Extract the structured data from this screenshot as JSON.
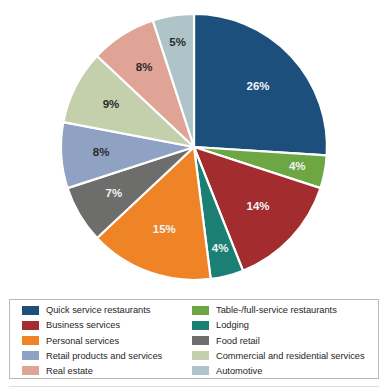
{
  "chart_data": {
    "type": "pie",
    "title": "",
    "subtitle": "",
    "xlabel": "",
    "ylabel": "",
    "grid": false,
    "legend_position": "bottom",
    "units": "percent",
    "total": 100,
    "start_angle_deg": 0,
    "direction": "clockwise",
    "categories": [
      "Quick service restaurants",
      "Table-/full-service restaurants",
      "Business services",
      "Lodging",
      "Personal services",
      "Food retail",
      "Retail products and services",
      "Commercial and residential services",
      "Real estate",
      "Automotive"
    ],
    "values": [
      26,
      4,
      14,
      4,
      15,
      7,
      8,
      9,
      8,
      5
    ],
    "slices": [
      {
        "label": "Quick service restaurants",
        "value": 26,
        "display": "26%",
        "color": "#1c4f7c",
        "label_color": "light"
      },
      {
        "label": "Table-/full-service restaurants",
        "value": 4,
        "display": "4%",
        "color": "#6da743",
        "label_color": "light"
      },
      {
        "label": "Business services",
        "value": 14,
        "display": "14%",
        "color": "#a32c2e",
        "label_color": "light"
      },
      {
        "label": "Lodging",
        "value": 4,
        "display": "4%",
        "color": "#1b7f73",
        "label_color": "light"
      },
      {
        "label": "Personal services",
        "value": 15,
        "display": "15%",
        "color": "#ef8426",
        "label_color": "light"
      },
      {
        "label": "Food retail",
        "value": 7,
        "display": "7%",
        "color": "#6d6d6b",
        "label_color": "light"
      },
      {
        "label": "Retail products and services",
        "value": 8,
        "display": "8%",
        "color": "#8fa2c3",
        "label_color": "dark"
      },
      {
        "label": "Commercial and residential services",
        "value": 9,
        "display": "9%",
        "color": "#c3d0ab",
        "label_color": "dark"
      },
      {
        "label": "Real estate",
        "value": 8,
        "display": "8%",
        "color": "#dfa496",
        "label_color": "dark"
      },
      {
        "label": "Automotive",
        "value": 5,
        "display": "5%",
        "color": "#aec4c9",
        "label_color": "dark"
      }
    ]
  },
  "legend": {
    "column_one": [
      {
        "label": "Quick service restaurants",
        "color": "#1c4f7c"
      },
      {
        "label": "Business services",
        "color": "#a32c2e"
      },
      {
        "label": "Personal services",
        "color": "#ef8426"
      },
      {
        "label": "Retail products and services",
        "color": "#8fa2c3"
      },
      {
        "label": "Real estate",
        "color": "#dfa496"
      }
    ],
    "column_two": [
      {
        "label": "Table-/full-service restaurants",
        "color": "#6da743"
      },
      {
        "label": "Lodging",
        "color": "#1b7f73"
      },
      {
        "label": "Food retail",
        "color": "#6d6d6b"
      },
      {
        "label": "Commercial and residential services",
        "color": "#c3d0ab"
      },
      {
        "label": "Automotive",
        "color": "#aec4c9"
      }
    ]
  },
  "geometry": {
    "center_x": 194,
    "center_y": 147,
    "radius": 133
  }
}
